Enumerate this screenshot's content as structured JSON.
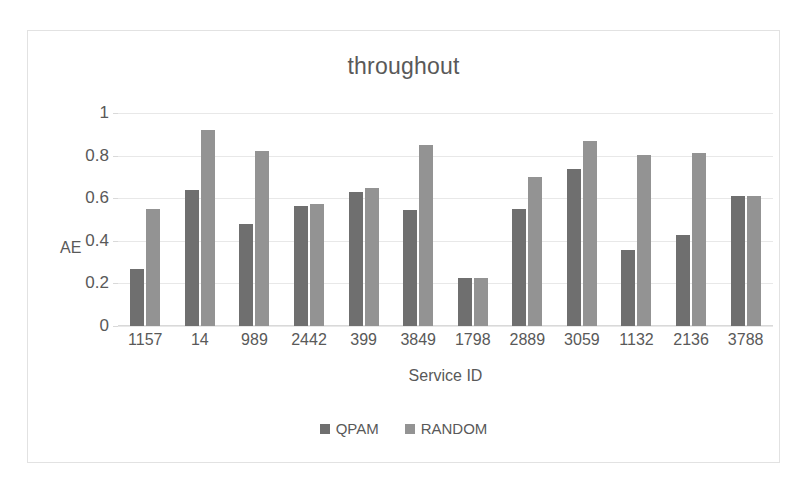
{
  "chart_data": {
    "type": "bar",
    "title": "throughout",
    "xlabel": "Service ID",
    "ylabel": "AE",
    "ylim": [
      0,
      1
    ],
    "yticks": [
      "0",
      "0.2",
      "0.4",
      "0.6",
      "0.8",
      "1"
    ],
    "grid": true,
    "legend_position": "bottom",
    "categories": [
      "1157",
      "14",
      "989",
      "2442",
      "399",
      "3849",
      "1798",
      "2889",
      "3059",
      "1132",
      "2136",
      "3788"
    ],
    "series": [
      {
        "name": "QPAM",
        "color": "#6f6f6f",
        "values": [
          0.27,
          0.64,
          0.48,
          0.565,
          0.63,
          0.545,
          0.225,
          0.55,
          0.735,
          0.355,
          0.425,
          0.61
        ]
      },
      {
        "name": "RANDOM",
        "color": "#939393",
        "values": [
          0.55,
          0.92,
          0.82,
          0.575,
          0.65,
          0.85,
          0.225,
          0.7,
          0.87,
          0.805,
          0.81,
          0.61
        ]
      }
    ]
  },
  "frame": {
    "border_color": "#e2e2e2",
    "background": "#ffffff"
  }
}
